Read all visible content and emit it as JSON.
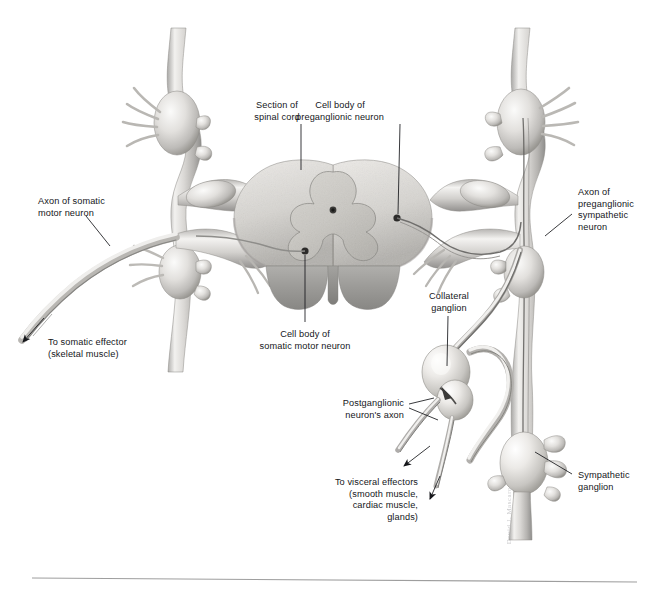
{
  "figure": {
    "background_color": "#ffffff",
    "ink_color": "#15161a",
    "tissue_light": "#e9e8e6",
    "tissue_mid": "#c9c7c3",
    "tissue_dark": "#9a9a9a",
    "gray_matter_color": "#c8c6c1",
    "white_matter_color": "#d9d8d5",
    "cut_surface_color": "#9d9d9d"
  },
  "labels": {
    "section_of_spinal_cord": {
      "text": "Section of\nspinal cord",
      "align": "center",
      "x": 277,
      "y": 100
    },
    "cell_body_preganglionic": {
      "text": "Cell body of\npreganglionic neuron",
      "align": "center",
      "x": 340,
      "y": 100
    },
    "axon_somatic_motor": {
      "text": "Axon of somatic\nmotor neuron",
      "align": "left",
      "x": 38,
      "y": 196
    },
    "axon_preganglionic_sympathetic": {
      "text": "Axon of\npreganglionic\nsympathetic\nneuron",
      "align": "left",
      "x": 578,
      "y": 187
    },
    "to_somatic_effector": {
      "text": "To somatic effector\n(skeletal muscle)",
      "align": "left",
      "x": 48,
      "y": 337
    },
    "cell_body_somatic_motor": {
      "text": "Cell body of\nsomatic motor neuron",
      "align": "center",
      "x": 277,
      "y": 329
    },
    "collateral_ganglion": {
      "text": "Collateral\nganglion",
      "align": "center",
      "x": 449,
      "y": 296
    },
    "postganglionic_neuron_axon": {
      "text": "Postganglionic\nneuron's axon",
      "align": "right",
      "x": 404,
      "y": 399
    },
    "to_visceral_effectors": {
      "text": "To visceral effectors\n(smooth muscle,\ncardiac muscle,\nglands)",
      "align": "right",
      "x": 418,
      "y": 478
    },
    "sympathetic_ganglion": {
      "text": "Sympathetic\nganglion",
      "align": "left",
      "x": 578,
      "y": 470
    }
  },
  "artist_signature": {
    "text": "David J. Mascaro",
    "x": 505,
    "y": 487
  },
  "structures": [
    {
      "name": "spinal-cord-section",
      "description": "Transverse section of spinal cord with butterfly-shaped gray matter"
    },
    {
      "name": "central-canal",
      "description": "Small dark dot at center of gray matter commissure"
    },
    {
      "name": "left-dorsal-root-ganglion",
      "description": "Swelling on left dorsal root"
    },
    {
      "name": "right-dorsal-root-ganglion",
      "description": "Swelling on right dorsal root"
    },
    {
      "name": "left-sympathetic-trunk",
      "description": "Vertical chain of ganglia on left"
    },
    {
      "name": "right-sympathetic-trunk",
      "description": "Vertical chain of ganglia on right"
    },
    {
      "name": "collateral-ganglion",
      "description": "Bulbous prevertebral ganglion lower right of centre"
    },
    {
      "name": "sympathetic-ganglion",
      "description": "Chain ganglion on right trunk, lower"
    },
    {
      "name": "somatic-motor-axon",
      "description": "Long axon sweeping to lower left"
    },
    {
      "name": "postganglionic-axons",
      "description": "Fibres leaving collateral ganglion toward visceral effectors"
    }
  ],
  "divider_rule": {
    "name": "bottom-rule",
    "x1": 32,
    "y1": 578,
    "x2": 637,
    "y2": 582,
    "color": "#9e9e9e"
  }
}
